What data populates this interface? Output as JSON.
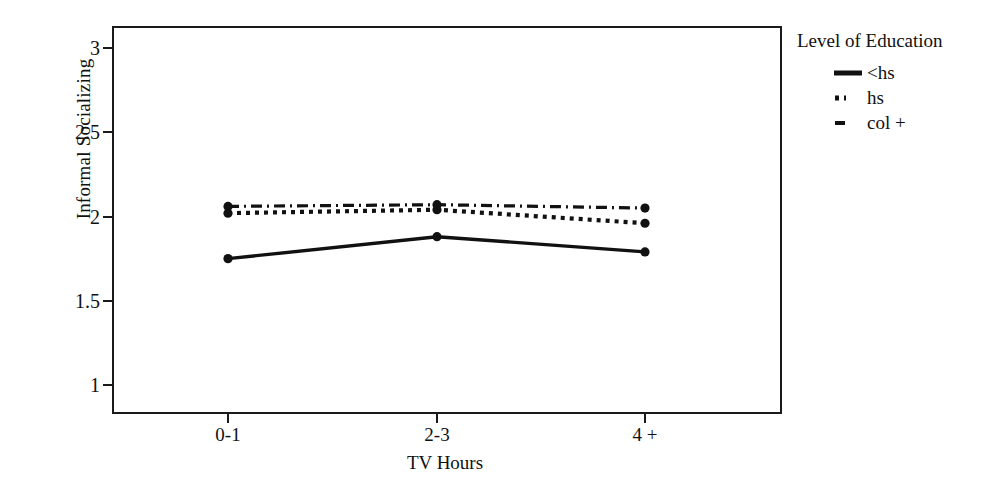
{
  "chart_data": {
    "type": "line",
    "title": "",
    "xlabel": "TV Hours",
    "ylabel": "Informal Socializing",
    "categories": [
      "0-1",
      "2-3",
      "4 +"
    ],
    "xtick_labels": [
      "0-1",
      "2-3",
      "4 +"
    ],
    "ytick_labels": [
      "1",
      "1.5",
      "2",
      "2.5",
      "3"
    ],
    "ytick_values": [
      1,
      1.5,
      2,
      2.5,
      3
    ],
    "ylim": [
      1,
      3
    ],
    "grid": false,
    "legend_position": "right",
    "legend_title": "Level of Education",
    "series": [
      {
        "name": "<hs",
        "style": "solid",
        "marker": "circle",
        "color": "#111111",
        "values": [
          1.75,
          1.88,
          1.79
        ]
      },
      {
        "name": "hs",
        "style": "dotted",
        "marker": "circle",
        "color": "#111111",
        "values": [
          2.02,
          2.04,
          1.96
        ]
      },
      {
        "name": "col +",
        "style": "dash-dot",
        "marker": "circle",
        "color": "#111111",
        "values": [
          2.06,
          2.07,
          2.05
        ]
      }
    ]
  },
  "axes": {
    "y_title": "Informal Socializing",
    "x_title": "TV Hours"
  },
  "legend": {
    "title": "Level of Education",
    "items": [
      {
        "label": "<hs",
        "swatch": "solid-line-swatch"
      },
      {
        "label": "hs",
        "swatch": "dotted-line-swatch"
      },
      {
        "label": "col +",
        "swatch": "dash-dot-line-swatch"
      }
    ]
  }
}
